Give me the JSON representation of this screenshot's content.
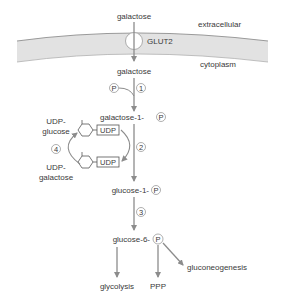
{
  "diagram": {
    "regions": {
      "extracellular": "extracellular",
      "cytoplasm": "cytoplasm"
    },
    "transporter": "GLUT2",
    "nodes": {
      "galactose_out": "galactose",
      "galactose_in": "galactose",
      "galactose_1_p": "galactose-1-",
      "glucose_1_p": "glucose-1-",
      "glucose_6_p": "glucose-6-",
      "glycolysis": "glycolysis",
      "ppp": "PPP",
      "gluconeogenesis": "gluconeogenesis",
      "udp_glucose_line1": "UDP-",
      "udp_glucose_line2": "glucose",
      "udp_galactose_line1": "UDP-",
      "udp_galactose_line2": "galactose",
      "udp_box_top": "UDP",
      "udp_box_bottom": "UDP"
    },
    "phosphate_symbol": "P",
    "steps": [
      "1",
      "2",
      "3",
      "4"
    ],
    "colors": {
      "membrane_fill": "#e2e2e2",
      "membrane_edge": "#9a9a9a",
      "arrow": "#8c8c8c",
      "text": "#3a3a3a"
    }
  }
}
